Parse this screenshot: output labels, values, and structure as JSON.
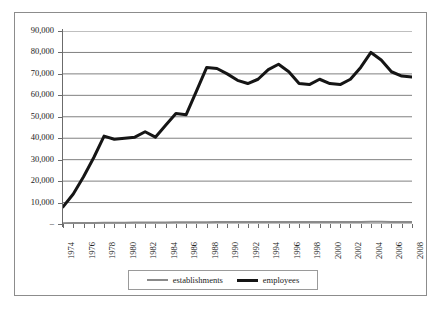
{
  "chart_data": {
    "type": "line",
    "title": "",
    "subtitle": "",
    "xlabel": "",
    "ylabel": "",
    "grid": true,
    "legend_position": "bottom",
    "xlim": [
      1974,
      2008
    ],
    "ylim": [
      0,
      90000
    ],
    "y_ticks": [
      0,
      10000,
      20000,
      30000,
      40000,
      50000,
      60000,
      70000,
      80000,
      90000
    ],
    "y_tick_labels": [
      "–",
      "10,000",
      "20,000",
      "30,000",
      "40,000",
      "50,000",
      "60,000",
      "70,000",
      "80,000",
      "90,000"
    ],
    "x": [
      1974,
      1975,
      1976,
      1977,
      1978,
      1979,
      1980,
      1981,
      1982,
      1983,
      1984,
      1985,
      1986,
      1987,
      1988,
      1989,
      1990,
      1991,
      1992,
      1993,
      1994,
      1995,
      1996,
      1997,
      1998,
      1999,
      2000,
      2001,
      2002,
      2003,
      2004,
      2005,
      2006,
      2007,
      2008
    ],
    "x_tick_labels": [
      "1974",
      "1976",
      "1978",
      "1980",
      "1982",
      "1984",
      "1986",
      "1988",
      "1990",
      "1992",
      "1994",
      "1996",
      "1998",
      "2000",
      "2002",
      "2004",
      "2006",
      "2008"
    ],
    "series": [
      {
        "name": "establishments",
        "color": "#8a8a8a",
        "width": 2,
        "values": [
          400,
          430,
          470,
          520,
          560,
          590,
          620,
          650,
          680,
          700,
          730,
          760,
          800,
          830,
          860,
          880,
          890,
          900,
          900,
          910,
          930,
          950,
          960,
          960,
          950,
          950,
          960,
          960,
          970,
          980,
          1000,
          1000,
          990,
          980,
          970
        ]
      },
      {
        "name": "employees",
        "color": "#151515",
        "width": 3,
        "values": [
          8000,
          14000,
          22000,
          31000,
          41000,
          39500,
          40000,
          40500,
          43000,
          40500,
          46000,
          51500,
          51000,
          62000,
          73000,
          72500,
          70000,
          67000,
          65500,
          67500,
          72000,
          74500,
          71000,
          65500,
          65000,
          67500,
          65500,
          65000,
          67500,
          73000,
          80000,
          76500,
          71000,
          69000,
          68500
        ]
      }
    ]
  },
  "legend": {
    "items": [
      {
        "label": "establishments",
        "color": "#8a8a8a"
      },
      {
        "label": "employees",
        "color": "#151515"
      }
    ]
  }
}
